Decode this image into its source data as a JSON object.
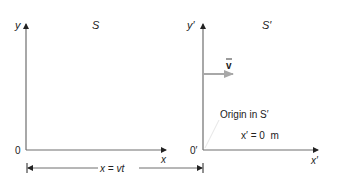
{
  "diagram": {
    "frame_s": {
      "name": "S",
      "y_axis_label": "y",
      "x_axis_label": "x",
      "origin_label": "0"
    },
    "frame_s_prime": {
      "name": "S′",
      "y_axis_label": "y′",
      "x_axis_label": "x′",
      "origin_label": "0′"
    },
    "velocity": {
      "label": "v",
      "vector_mark": "→"
    },
    "annotation": {
      "line1": "Origin in S′",
      "line2": "x′ = 0  m"
    },
    "displacement": {
      "label": "x = vt"
    },
    "colors": {
      "axis": "#6e6e6e",
      "velocity_arrow": "#a8a8a8",
      "text": "#222222",
      "leader_line": "#e6e6e6"
    }
  }
}
